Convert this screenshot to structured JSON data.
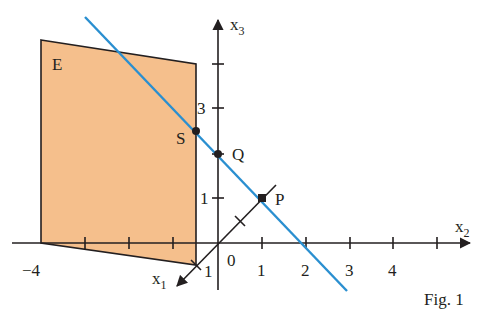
{
  "figure": {
    "caption": "Fig. 1",
    "colors": {
      "plane_fill": "#f5bf8c",
      "plane_stroke": "#231f20",
      "line": "#2a8fd0",
      "axes": "#231f20"
    },
    "axes": {
      "x1": {
        "label": "x",
        "sub": "1",
        "tick_label": "1"
      },
      "x2": {
        "label": "x",
        "sub": "2",
        "tick_labels": [
          "−4",
          "1",
          "2",
          "3",
          "4"
        ]
      },
      "x3": {
        "label": "x",
        "sub": "3",
        "tick_labels": [
          "1",
          "3"
        ]
      },
      "origin_label": "0"
    },
    "plane": {
      "label": "E"
    },
    "points": [
      {
        "name": "S",
        "label": "S"
      },
      {
        "name": "Q",
        "label": "Q"
      },
      {
        "name": "P",
        "label": "P"
      }
    ]
  }
}
